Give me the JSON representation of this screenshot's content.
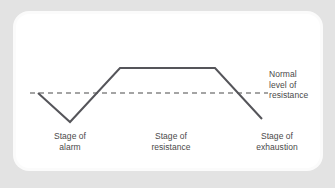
{
  "figure": {
    "background_color": "#e3e3e3",
    "card_color": "#ffffff"
  },
  "annotations": {
    "baseline_label": {
      "line1": "Normal",
      "line2": "level of",
      "line3": "resistance"
    }
  },
  "stages": [
    {
      "line1": "Stage of",
      "line2": "alarm"
    },
    {
      "line1": "Stage of",
      "line2": "resistance"
    },
    {
      "line1": "Stage of",
      "line2": "exhaustion"
    }
  ],
  "chart_data": {
    "type": "line",
    "xlabel": "",
    "ylabel": "Level of resistance",
    "grid": false,
    "legend": "none",
    "xlim": [
      0,
      304
    ],
    "ylim": [
      0,
      154
    ],
    "series": [
      {
        "name": "Resistance to stress",
        "color": "#55555a",
        "stroke_width": 2,
        "points": [
          {
            "x": 22,
            "y": 79,
            "label": "onset / normal level"
          },
          {
            "x": 54,
            "y": 108,
            "label": "alarm trough (below normal)"
          },
          {
            "x": 104,
            "y": 54,
            "label": "rise to resistance plateau"
          },
          {
            "x": 199,
            "y": 54,
            "label": "end of resistance plateau"
          },
          {
            "x": 246,
            "y": 105,
            "label": "exhaustion (below normal)"
          }
        ]
      }
    ],
    "reference_lines": [
      {
        "name": "normal-level-of-resistance",
        "orientation": "horizontal",
        "y": 79,
        "x_start": 14,
        "x_end": 252,
        "style": "dashed",
        "color": "#4a4a4a",
        "label": "Normal level of resistance"
      }
    ],
    "stage_regions": [
      {
        "name": "Stage of alarm",
        "x_center": 54
      },
      {
        "name": "Stage of resistance",
        "x_center": 155
      },
      {
        "name": "Stage of exhaustion",
        "x_center": 261
      }
    ]
  }
}
